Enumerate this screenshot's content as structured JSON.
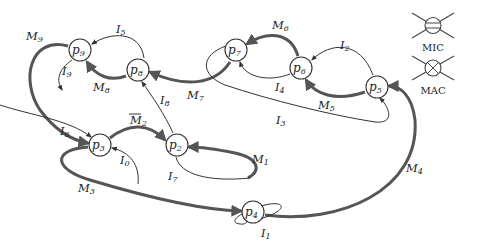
{
  "diagram": {
    "type": "state-transition-graph",
    "nodes": [
      {
        "id": "p2",
        "label": "p",
        "sub": "2",
        "x": 177,
        "y": 145
      },
      {
        "id": "p3",
        "label": "p",
        "sub": "3",
        "x": 100,
        "y": 145
      },
      {
        "id": "p4",
        "label": "p",
        "sub": "4",
        "x": 253,
        "y": 212
      },
      {
        "id": "p5",
        "label": "p",
        "sub": "5",
        "x": 377,
        "y": 87
      },
      {
        "id": "p6",
        "label": "p",
        "sub": "6",
        "x": 301,
        "y": 68
      },
      {
        "id": "p7",
        "label": "p",
        "sub": "7",
        "x": 236,
        "y": 50
      },
      {
        "id": "p8",
        "label": "p",
        "sub": "8",
        "x": 138,
        "y": 70
      },
      {
        "id": "p9",
        "label": "p",
        "sub": "9",
        "x": 80,
        "y": 50
      }
    ],
    "edges": [
      {
        "id": "M1",
        "label": "M",
        "sub": "1",
        "kind": "thick",
        "from": "p2",
        "to": "p2"
      },
      {
        "id": "M2bar",
        "label": "M",
        "sub": "2",
        "overline": true,
        "kind": "thick",
        "from": "p3",
        "to": "p2"
      },
      {
        "id": "M3",
        "label": "M",
        "sub": "3",
        "kind": "thick",
        "from": "p3",
        "to": "p4"
      },
      {
        "id": "M4",
        "label": "M",
        "sub": "4",
        "kind": "thick",
        "from": "p4",
        "to": "p5"
      },
      {
        "id": "M5",
        "label": "M",
        "sub": "5",
        "kind": "thick",
        "from": "p5",
        "to": "p6"
      },
      {
        "id": "M6",
        "label": "M",
        "sub": "6",
        "kind": "thick",
        "from": "p6",
        "to": "p7"
      },
      {
        "id": "M7",
        "label": "M",
        "sub": "7",
        "kind": "thick",
        "from": "p7",
        "to": "p8"
      },
      {
        "id": "M8",
        "label": "M",
        "sub": "8",
        "kind": "thick",
        "from": "p8",
        "to": "p9"
      },
      {
        "id": "M9",
        "label": "M",
        "sub": "9",
        "kind": "thick",
        "from": "p9",
        "to": "p3"
      },
      {
        "id": "I0",
        "label": "I",
        "sub": "0",
        "kind": "thin",
        "from": "start",
        "to": "p3"
      },
      {
        "id": "I1",
        "label": "I",
        "sub": "1",
        "kind": "thin",
        "from": "p4",
        "to": "p4"
      },
      {
        "id": "I2",
        "label": "I",
        "sub": "2",
        "kind": "thin",
        "from": "p5",
        "to": "p6"
      },
      {
        "id": "I3",
        "label": "I",
        "sub": "3",
        "kind": "thin",
        "from": "p7",
        "to": "p5"
      },
      {
        "id": "I4",
        "label": "I",
        "sub": "4",
        "kind": "thin",
        "from": "p6",
        "to": "p7"
      },
      {
        "id": "I5",
        "label": "I",
        "sub": "5",
        "kind": "thin",
        "from": "p8",
        "to": "p9"
      },
      {
        "id": "I6",
        "label": "I",
        "sub": "6",
        "kind": "thin",
        "from": "p9",
        "to": "p3"
      },
      {
        "id": "I7",
        "label": "I",
        "sub": "7",
        "kind": "thin",
        "from": "p2",
        "to": "p2"
      },
      {
        "id": "I8",
        "label": "I",
        "sub": "8",
        "kind": "thin",
        "from": "p2",
        "to": "p8"
      },
      {
        "id": "I9",
        "label": "I",
        "sub": "9",
        "kind": "thin",
        "from": "p9",
        "to": "end"
      }
    ]
  },
  "legend": {
    "items": [
      {
        "symbol": "mic-symbol",
        "label": "MIC"
      },
      {
        "symbol": "mac-symbol",
        "label": "MAC"
      }
    ]
  },
  "colors": {
    "thick_edge": "#555555",
    "thin_edge": "#333333",
    "background": "#ffffff"
  }
}
